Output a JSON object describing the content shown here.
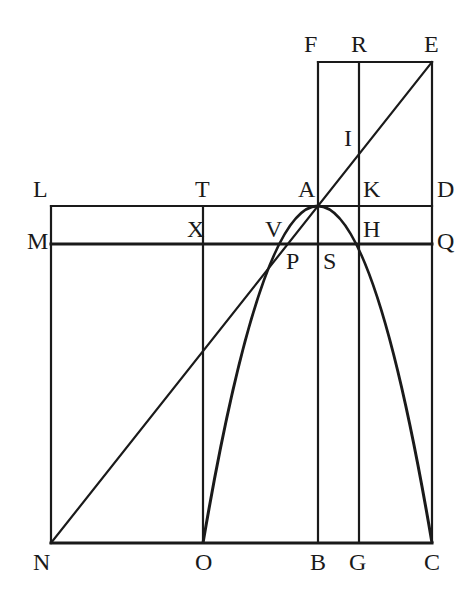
{
  "diagram": {
    "type": "geometric-construction",
    "stroke_color": "#1a1a1a",
    "background": "#ffffff",
    "points": {
      "F": {
        "label": "F",
        "x": 318,
        "y": 62
      },
      "R": {
        "label": "R",
        "x": 359,
        "y": 62
      },
      "E": {
        "label": "E",
        "x": 432,
        "y": 62
      },
      "I": {
        "label": "I",
        "x": 359,
        "y": 151
      },
      "L": {
        "label": "L",
        "x": 51,
        "y": 206
      },
      "T": {
        "label": "T",
        "x": 203,
        "y": 206
      },
      "A": {
        "label": "A",
        "x": 318,
        "y": 206
      },
      "K": {
        "label": "K",
        "x": 359,
        "y": 206
      },
      "D": {
        "label": "D",
        "x": 432,
        "y": 206
      },
      "M": {
        "label": "M",
        "x": 51,
        "y": 244
      },
      "X": {
        "label": "X",
        "x": 203,
        "y": 244
      },
      "V": {
        "label": "V",
        "x": 271,
        "y": 244
      },
      "P": {
        "label": "P",
        "x": 281,
        "y": 244
      },
      "S": {
        "label": "S",
        "x": 318,
        "y": 244
      },
      "H": {
        "label": "H",
        "x": 359,
        "y": 244
      },
      "Q": {
        "label": "Q",
        "x": 432,
        "y": 244
      },
      "N": {
        "label": "N",
        "x": 51,
        "y": 543
      },
      "O": {
        "label": "O",
        "x": 203,
        "y": 543
      },
      "B": {
        "label": "B",
        "x": 318,
        "y": 543
      },
      "G": {
        "label": "G",
        "x": 359,
        "y": 543
      },
      "C": {
        "label": "C",
        "x": 432,
        "y": 543
      }
    },
    "labels": {
      "F": "F",
      "R": "R",
      "E": "E",
      "I": "I",
      "L": "L",
      "T": "T",
      "A": "A",
      "K": "K",
      "D": "D",
      "M": "M",
      "X": "X",
      "V": "V",
      "P": "P",
      "S": "S",
      "H": "H",
      "Q": "Q",
      "N": "N",
      "O": "O",
      "B": "B",
      "G": "G",
      "C": "C"
    },
    "segments": [
      [
        "F",
        "E"
      ],
      [
        "F",
        "B"
      ],
      [
        "R",
        "G"
      ],
      [
        "E",
        "C"
      ],
      [
        "L",
        "D"
      ],
      [
        "M",
        "Q"
      ],
      [
        "L",
        "N"
      ],
      [
        "N",
        "C"
      ],
      [
        "T",
        "O"
      ],
      [
        "N",
        "E"
      ]
    ],
    "curves": [
      {
        "type": "parabola",
        "vertex": "A",
        "through": [
          "O",
          "C",
          "H",
          "V"
        ]
      }
    ]
  }
}
